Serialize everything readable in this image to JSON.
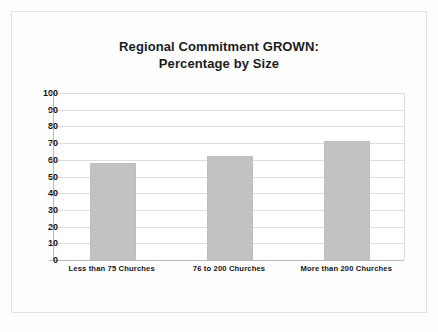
{
  "chart_data": {
    "type": "bar",
    "title": "Regional Commitment GROWN: Percentage by Size",
    "title_line1": "Regional Commitment GROWN:",
    "title_line2": "Percentage by Size",
    "xlabel": "",
    "ylabel": "",
    "categories": [
      "Less than 75 Churches",
      "76 to 200 Churches",
      "More than 200 Churches"
    ],
    "values": [
      58,
      62,
      71
    ],
    "ylim": [
      0,
      100
    ],
    "ytick_values": [
      100,
      90,
      80,
      70,
      60,
      50,
      40,
      30,
      20,
      10,
      0
    ],
    "ytick_labels": [
      "100",
      "90",
      "80",
      "70",
      "60",
      "50",
      "40",
      "30",
      "20",
      "10",
      "0"
    ],
    "grid": true,
    "legend": false,
    "bar_color": "#c2c2c2",
    "gridline_color": "#dedede",
    "axis_color": "#b9b9b9",
    "plot_background": "#ffffff",
    "frame_color": "#e2e2e2",
    "text_color": "#111111"
  }
}
